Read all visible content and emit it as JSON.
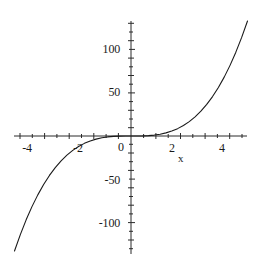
{
  "chart_data": {
    "type": "line",
    "title": "",
    "subtitle": "",
    "xlabel": "x",
    "ylabel": "",
    "function": "y = x^3",
    "xlim": [
      -5.0,
      5.0
    ],
    "ylim": [
      -125,
      125
    ],
    "grid": false,
    "legend": null,
    "axis_origin": {
      "x": 0,
      "y": 0
    },
    "x_ticks_labeled": [
      -4,
      -2,
      0,
      2,
      4
    ],
    "x_tick_labels": [
      "-4",
      "-2",
      "0",
      "2",
      "4"
    ],
    "y_ticks_labeled": [
      -100,
      -50,
      50,
      100
    ],
    "y_tick_labels": [
      "-100",
      "-50",
      "50",
      "100"
    ],
    "x_minor_tick_step": 0.5,
    "y_minor_tick_step": 10,
    "series": [
      {
        "name": "y = x^3",
        "color": "#1a1a1a",
        "x": [
          -5.0,
          -4.75,
          -4.5,
          -4.25,
          -4.0,
          -3.75,
          -3.5,
          -3.25,
          -3.0,
          -2.75,
          -2.5,
          -2.25,
          -2.0,
          -1.75,
          -1.5,
          -1.25,
          -1.0,
          -0.75,
          -0.5,
          -0.25,
          0.0,
          0.25,
          0.5,
          0.75,
          1.0,
          1.25,
          1.5,
          1.75,
          2.0,
          2.25,
          2.5,
          2.75,
          3.0,
          3.25,
          3.5,
          3.75,
          4.0,
          4.25,
          4.5,
          4.75,
          5.0
        ],
        "y": [
          -125.0,
          -107.17,
          -91.13,
          -76.77,
          -64.0,
          -52.73,
          -42.88,
          -34.33,
          -27.0,
          -20.8,
          -15.63,
          -11.39,
          -8.0,
          -5.36,
          -3.38,
          -1.95,
          -1.0,
          -0.42,
          -0.13,
          -0.02,
          0.0,
          0.02,
          0.13,
          0.42,
          1.0,
          1.95,
          3.38,
          5.36,
          8.0,
          11.39,
          15.63,
          20.8,
          27.0,
          34.33,
          42.88,
          52.73,
          64.0,
          76.77,
          91.13,
          107.17,
          125.0
        ]
      }
    ]
  },
  "labels": {
    "y_100": "100",
    "y_50": "50",
    "y_neg50": "-50",
    "y_neg100": "-100",
    "x_neg4": "-4",
    "x_neg2": "-2",
    "x_0": "0",
    "x_2": "2",
    "x_4": "4",
    "x_axis_name": "x"
  },
  "colors": {
    "background": "#ffffff",
    "axis": "#2b2b2b",
    "curve": "#1a1a1a",
    "text": "#1a1a1a"
  }
}
